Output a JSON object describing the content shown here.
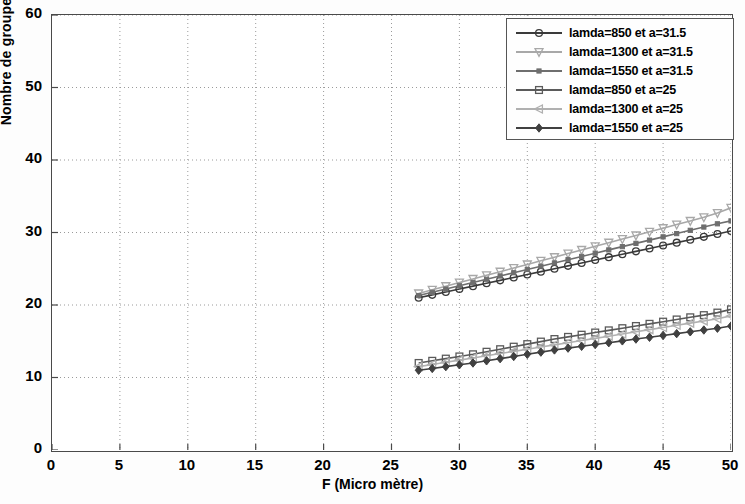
{
  "chart_data": {
    "type": "line",
    "title": "",
    "xlabel": "F (Micro mètre)",
    "ylabel": "Nombre de groupe de mode",
    "xlim": [
      0,
      50
    ],
    "ylim": [
      0,
      60
    ],
    "xticks": [
      0,
      5,
      10,
      15,
      20,
      25,
      30,
      35,
      40,
      45,
      50
    ],
    "yticks": [
      0,
      10,
      20,
      30,
      40,
      50,
      60
    ],
    "grid": true,
    "grid_style": "dotted",
    "legend_position": "top-right",
    "x": [
      27,
      28,
      29,
      30,
      31,
      32,
      33,
      34,
      35,
      36,
      37,
      38,
      39,
      40,
      41,
      42,
      43,
      44,
      45,
      46,
      47,
      48,
      49,
      50
    ],
    "series": [
      {
        "name": "lamda=850 et a=31.5",
        "marker": "circle",
        "color": "#3a3a3a",
        "values": [
          21.0,
          21.4,
          21.8,
          22.2,
          22.6,
          23.0,
          23.4,
          23.8,
          24.2,
          24.6,
          25.0,
          25.4,
          25.8,
          26.2,
          26.6,
          27.0,
          27.4,
          27.8,
          28.2,
          28.6,
          29.0,
          29.4,
          29.8,
          30.2
        ]
      },
      {
        "name": "lamda=1300 et a=31.5",
        "marker": "triangle-down",
        "color": "#a8a8a8",
        "values": [
          21.6,
          22.1,
          22.6,
          23.1,
          23.6,
          24.1,
          24.6,
          25.1,
          25.6,
          26.1,
          26.6,
          27.1,
          27.6,
          28.1,
          28.6,
          29.1,
          29.6,
          30.1,
          30.6,
          31.1,
          31.6,
          32.1,
          32.7,
          33.4
        ]
      },
      {
        "name": "lamda=1550 et a=31.5",
        "marker": "square-small",
        "color": "#6e6e6e",
        "values": [
          21.3,
          21.75,
          22.2,
          22.65,
          23.1,
          23.55,
          24.0,
          24.45,
          24.9,
          25.35,
          25.8,
          26.25,
          26.7,
          27.15,
          27.6,
          28.05,
          28.5,
          28.95,
          29.4,
          29.85,
          30.3,
          30.75,
          31.2,
          31.6
        ]
      },
      {
        "name": "lamda=850 et a=25",
        "marker": "square-open",
        "color": "#5a5a5a",
        "values": [
          12.0,
          12.3,
          12.6,
          12.9,
          13.2,
          13.55,
          13.9,
          14.25,
          14.6,
          14.95,
          15.3,
          15.6,
          15.9,
          16.2,
          16.5,
          16.8,
          17.1,
          17.4,
          17.7,
          18.0,
          18.3,
          18.6,
          18.95,
          19.4
        ]
      },
      {
        "name": "lamda=1300 et a=25",
        "marker": "triangle-left",
        "color": "#b0b0b0",
        "values": [
          11.5,
          11.8,
          12.1,
          12.4,
          12.7,
          13.0,
          13.3,
          13.6,
          13.9,
          14.2,
          14.5,
          14.8,
          15.1,
          15.4,
          15.7,
          16.0,
          16.3,
          16.6,
          16.9,
          17.2,
          17.5,
          17.8,
          18.1,
          18.5
        ]
      },
      {
        "name": "lamda=1550 et a=25",
        "marker": "diamond",
        "color": "#404040",
        "values": [
          11.0,
          11.25,
          11.5,
          11.75,
          12.0,
          12.3,
          12.6,
          12.9,
          13.2,
          13.5,
          13.8,
          14.05,
          14.3,
          14.55,
          14.8,
          15.05,
          15.3,
          15.55,
          15.8,
          16.05,
          16.3,
          16.55,
          16.8,
          17.1
        ]
      }
    ]
  },
  "axes": {
    "ylabel": "Nombre de groupe de mode",
    "xlabel": "F (Micro mètre)",
    "ytick_labels": [
      "0",
      "10",
      "20",
      "30",
      "40",
      "50",
      "60"
    ],
    "xtick_labels": [
      "0",
      "5",
      "10",
      "15",
      "20",
      "25",
      "30",
      "35",
      "40",
      "45",
      "50"
    ]
  },
  "legend": {
    "entries": [
      "lamda=850 et a=31.5",
      "lamda=1300 et a=31.5",
      "lamda=1550 et a=31.5",
      "lamda=850 et a=25",
      "lamda=1300 et a=25",
      "lamda=1550 et a=25"
    ]
  }
}
